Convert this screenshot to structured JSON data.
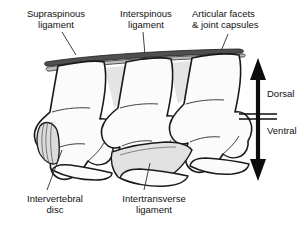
{
  "figure": {
    "type": "anatomical-line-diagram",
    "background_color": "#ffffff",
    "line_color": "#1a1a1a",
    "shade_light": "#e8e8e8",
    "shade_mid": "#d8d8d8",
    "shade_dark": "#4a4a4a"
  },
  "labels": {
    "supraspinous": "Supraspinous\nligament",
    "interspinous": "Interspinous\nligament",
    "articular_facets": "Articular facets\n& joint capsules",
    "intervertebral_disc": "Intervertebral\ndisc",
    "intertransverse": "Intertransverse\nligament"
  },
  "orientation": {
    "dorsal": "Dorsal",
    "ventral": "Ventral"
  }
}
